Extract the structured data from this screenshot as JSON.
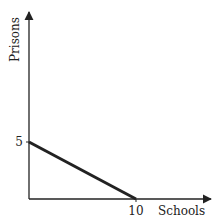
{
  "chart_data": {
    "type": "line",
    "title": "",
    "xlabel": "Schools",
    "ylabel": "Prisons",
    "xlim": [
      0,
      10
    ],
    "ylim": [
      0,
      5
    ],
    "x_ticks": [
      "10"
    ],
    "y_ticks": [
      "5"
    ],
    "grid": false,
    "series": [
      {
        "name": "possibilities frontier",
        "x": [
          0,
          10
        ],
        "y": [
          5,
          0
        ],
        "color": "#222222"
      }
    ]
  }
}
